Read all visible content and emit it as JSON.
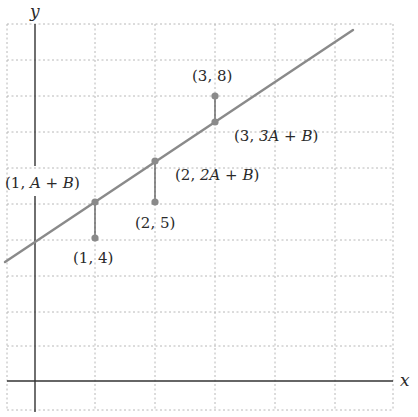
{
  "diagram": {
    "type": "least-squares-line",
    "axes": {
      "x_label": "x",
      "y_label": "y"
    },
    "colors": {
      "grid": "#b8b8b8",
      "axis": "#333333",
      "line": "#8a8a8a",
      "point": "#8a8a8a",
      "residual": "#555555",
      "text": "#2a2a2a"
    },
    "data_points": [
      {
        "x": 1,
        "y": 4,
        "label": "(1, 4)"
      },
      {
        "x": 2,
        "y": 5,
        "label": "(2, 5)"
      },
      {
        "x": 3,
        "y": 8,
        "label": "(3, 8)"
      }
    ],
    "fitted_points": [
      {
        "x": 1,
        "label_pre": "(1, ",
        "label_expr": "A + B",
        "label_post": ")"
      },
      {
        "x": 2,
        "label_pre": "(2, ",
        "label_expr": "2A + B",
        "label_post": ")"
      },
      {
        "x": 3,
        "label_pre": "(3, ",
        "label_expr": "3A + B",
        "label_post": ")"
      }
    ],
    "line_label": "y = Ax + B"
  }
}
